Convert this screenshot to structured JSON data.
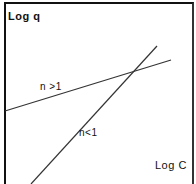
{
  "diagram": {
    "y_axis_label": "Log q",
    "x_axis_label": "Log C",
    "lines": [
      {
        "label": "n >1",
        "x1": 5,
        "y1": 111,
        "x2": 171,
        "y2": 60
      },
      {
        "label": "n<1",
        "x1": 31,
        "y1": 184,
        "x2": 157,
        "y2": 46
      }
    ],
    "line_color": "#333333"
  }
}
